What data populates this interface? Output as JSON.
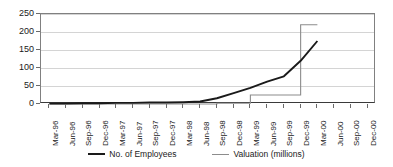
{
  "chart_data": {
    "type": "line",
    "title": "",
    "subtitle": "",
    "xlabel": "",
    "ylabel": "",
    "ylim": [
      0,
      250
    ],
    "ytick_values": [
      0,
      50,
      100,
      150,
      200,
      250
    ],
    "ytick_labels": [
      "0",
      "50",
      "100",
      "150",
      "200",
      "250"
    ],
    "grid": true,
    "legend_position": "bottom",
    "categories": [
      "Mar-96",
      "Jun-96",
      "Sep-96",
      "Dec-96",
      "Mar-97",
      "Jun-97",
      "Sep-97",
      "Dec-97",
      "Mar-98",
      "Jun-98",
      "Sep-98",
      "Dec-98",
      "Mar-99",
      "Jun-99",
      "Sep-99",
      "Dec-99",
      "Mar-00",
      "Jun-00",
      "Sep-00",
      "Dec-00"
    ],
    "series": [
      {
        "name": "No. of Employees",
        "color": "#1a1a1a",
        "width": 2,
        "values": [
          1,
          1,
          2,
          2,
          3,
          3,
          4,
          4,
          5,
          7,
          16,
          30,
          45,
          62,
          77,
          120,
          175,
          null,
          null,
          null
        ]
      },
      {
        "name": "Valuation (millions)",
        "color": "#8c8c8c",
        "width": 1,
        "step": true,
        "values": [
          0,
          0,
          0,
          0,
          0,
          0,
          0,
          0,
          0,
          0,
          2,
          2,
          25,
          25,
          25,
          220,
          220,
          null,
          null,
          null
        ]
      }
    ]
  },
  "legend": {
    "entries": [
      {
        "label": "No. of Employees"
      },
      {
        "label": "Valuation (millions)"
      }
    ]
  },
  "colors": {
    "employees_line": "#1a1a1a",
    "valuation_line": "#8c8c8c",
    "gridline": "#d4d4d4",
    "axis": "#808080",
    "background": "#ffffff"
  }
}
